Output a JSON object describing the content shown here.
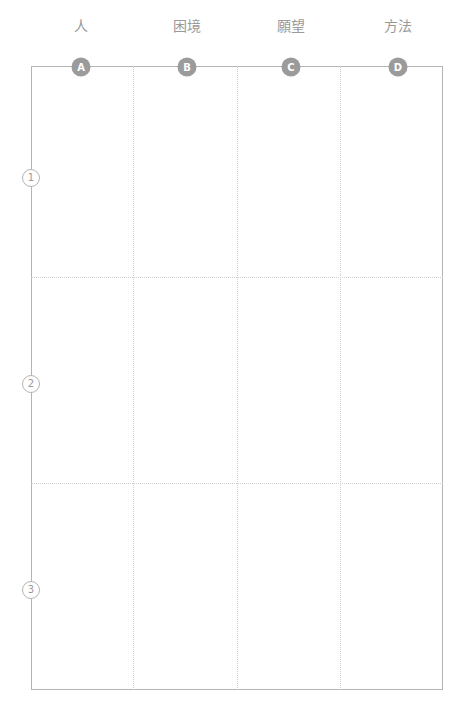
{
  "worksheet": {
    "title": "",
    "columns": [
      {
        "id": "A",
        "badge": "A",
        "label": "人",
        "center_x": 81
      },
      {
        "id": "B",
        "badge": "B",
        "label": "困境",
        "center_x": 187
      },
      {
        "id": "C",
        "badge": "C",
        "label": "願望",
        "center_x": 291
      },
      {
        "id": "D",
        "badge": "D",
        "label": "方法",
        "center_x": 398
      }
    ],
    "rows": [
      {
        "id": "1",
        "badge": "1",
        "center_y": 178
      },
      {
        "id": "2",
        "badge": "2",
        "center_y": 384
      },
      {
        "id": "3",
        "badge": "3",
        "center_y": 590
      }
    ],
    "cells": [
      {
        "row": "1",
        "col": "A",
        "value": ""
      },
      {
        "row": "1",
        "col": "B",
        "value": ""
      },
      {
        "row": "1",
        "col": "C",
        "value": ""
      },
      {
        "row": "1",
        "col": "D",
        "value": ""
      },
      {
        "row": "2",
        "col": "A",
        "value": ""
      },
      {
        "row": "2",
        "col": "B",
        "value": ""
      },
      {
        "row": "2",
        "col": "C",
        "value": ""
      },
      {
        "row": "2",
        "col": "D",
        "value": ""
      },
      {
        "row": "3",
        "col": "A",
        "value": ""
      },
      {
        "row": "3",
        "col": "B",
        "value": ""
      },
      {
        "row": "3",
        "col": "C",
        "value": ""
      },
      {
        "row": "3",
        "col": "D",
        "value": ""
      }
    ],
    "geometry": {
      "frame_left": 31,
      "frame_top": 66,
      "frame_right": 443,
      "frame_bottom": 690,
      "v_dividers": [
        133,
        237,
        340
      ],
      "h_dividers": [
        277,
        483
      ]
    },
    "colors": {
      "background": "#ffffff",
      "frame_border": "#b4b4b4",
      "divider": "#cfcfcf",
      "badge_fill": "#9b9b9b",
      "badge_text": "#ffffff",
      "label_text": "#9a9a9a"
    }
  }
}
